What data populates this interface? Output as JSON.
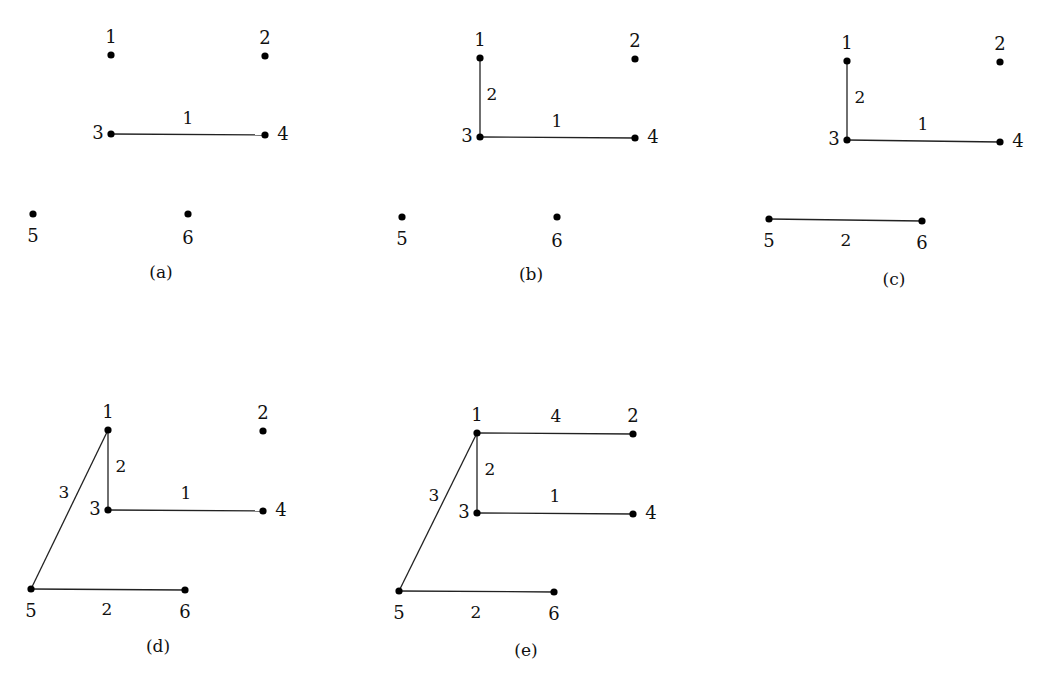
{
  "figure": {
    "vertices": [
      "1",
      "2",
      "3",
      "4",
      "5",
      "6"
    ],
    "panels": [
      {
        "id": "a",
        "caption": "(a)",
        "nodes": [
          {
            "id": "1",
            "x": 111,
            "y": 55,
            "label_dx": 0,
            "label_dy": -12
          },
          {
            "id": "2",
            "x": 265,
            "y": 56,
            "label_dx": 0,
            "label_dy": -12
          },
          {
            "id": "3",
            "x": 111,
            "y": 134,
            "label_dx": -13,
            "label_dy": 5
          },
          {
            "id": "4",
            "x": 265,
            "y": 135,
            "label_dx": 18,
            "label_dy": 5
          },
          {
            "id": "5",
            "x": 33,
            "y": 214,
            "label_dx": 0,
            "label_dy": 28
          },
          {
            "id": "6",
            "x": 188,
            "y": 214,
            "label_dx": 0,
            "label_dy": 30
          }
        ],
        "edges": [
          {
            "from": "3",
            "to": "4",
            "weight": "1",
            "wx": 188,
            "wy": 124
          }
        ],
        "caption_x": 161,
        "caption_y": 278
      },
      {
        "id": "b",
        "caption": "(b)",
        "nodes": [
          {
            "id": "1",
            "x": 480,
            "y": 58,
            "label_dx": 0,
            "label_dy": -12
          },
          {
            "id": "2",
            "x": 635,
            "y": 59,
            "label_dx": 0,
            "label_dy": -12
          },
          {
            "id": "3",
            "x": 480,
            "y": 137,
            "label_dx": -13,
            "label_dy": 5
          },
          {
            "id": "4",
            "x": 635,
            "y": 138,
            "label_dx": 18,
            "label_dy": 5
          },
          {
            "id": "5",
            "x": 402,
            "y": 217,
            "label_dx": 0,
            "label_dy": 28
          },
          {
            "id": "6",
            "x": 557,
            "y": 217,
            "label_dx": 0,
            "label_dy": 30
          }
        ],
        "edges": [
          {
            "from": "3",
            "to": "4",
            "weight": "1",
            "wx": 557,
            "wy": 127
          },
          {
            "from": "1",
            "to": "3",
            "weight": "2",
            "wx": 492,
            "wy": 100
          }
        ],
        "caption_x": 531,
        "caption_y": 280
      },
      {
        "id": "c",
        "caption": "(c)",
        "nodes": [
          {
            "id": "1",
            "x": 847,
            "y": 61,
            "label_dx": 0,
            "label_dy": -12
          },
          {
            "id": "2",
            "x": 1000,
            "y": 62,
            "label_dx": 0,
            "label_dy": -12
          },
          {
            "id": "3",
            "x": 847,
            "y": 140,
            "label_dx": -13,
            "label_dy": 5
          },
          {
            "id": "4",
            "x": 1000,
            "y": 142,
            "label_dx": 18,
            "label_dy": 5
          },
          {
            "id": "5",
            "x": 769,
            "y": 219,
            "label_dx": 0,
            "label_dy": 28
          },
          {
            "id": "6",
            "x": 922,
            "y": 221,
            "label_dx": 0,
            "label_dy": 28
          }
        ],
        "edges": [
          {
            "from": "3",
            "to": "4",
            "weight": "1",
            "wx": 923,
            "wy": 130
          },
          {
            "from": "1",
            "to": "3",
            "weight": "2",
            "wx": 860,
            "wy": 103
          },
          {
            "from": "5",
            "to": "6",
            "weight": "2",
            "wx": 846,
            "wy": 246
          }
        ],
        "caption_x": 894,
        "caption_y": 285
      },
      {
        "id": "d",
        "caption": "(d)",
        "nodes": [
          {
            "id": "1",
            "x": 108,
            "y": 430,
            "label_dx": 0,
            "label_dy": -12
          },
          {
            "id": "2",
            "x": 263,
            "y": 431,
            "label_dx": 0,
            "label_dy": -12
          },
          {
            "id": "3",
            "x": 108,
            "y": 510,
            "label_dx": -13,
            "label_dy": 5
          },
          {
            "id": "4",
            "x": 263,
            "y": 511,
            "label_dx": 18,
            "label_dy": 5
          },
          {
            "id": "5",
            "x": 31,
            "y": 589,
            "label_dx": 0,
            "label_dy": 28
          },
          {
            "id": "6",
            "x": 185,
            "y": 590,
            "label_dx": 0,
            "label_dy": 28
          }
        ],
        "edges": [
          {
            "from": "3",
            "to": "4",
            "weight": "1",
            "wx": 186,
            "wy": 499
          },
          {
            "from": "1",
            "to": "3",
            "weight": "2",
            "wx": 121,
            "wy": 472
          },
          {
            "from": "5",
            "to": "6",
            "weight": "2",
            "wx": 107,
            "wy": 615
          },
          {
            "from": "1",
            "to": "5",
            "weight": "3",
            "wx": 64,
            "wy": 498
          }
        ],
        "caption_x": 158,
        "caption_y": 652
      },
      {
        "id": "e",
        "caption": "(e)",
        "nodes": [
          {
            "id": "1",
            "x": 477,
            "y": 433,
            "label_dx": 0,
            "label_dy": -12
          },
          {
            "id": "2",
            "x": 633,
            "y": 434,
            "label_dx": 0,
            "label_dy": -12
          },
          {
            "id": "3",
            "x": 477,
            "y": 513,
            "label_dx": -13,
            "label_dy": 5
          },
          {
            "id": "4",
            "x": 633,
            "y": 514,
            "label_dx": 18,
            "label_dy": 5
          },
          {
            "id": "5",
            "x": 399,
            "y": 591,
            "label_dx": 0,
            "label_dy": 28
          },
          {
            "id": "6",
            "x": 554,
            "y": 592,
            "label_dx": 0,
            "label_dy": 28
          }
        ],
        "edges": [
          {
            "from": "3",
            "to": "4",
            "weight": "1",
            "wx": 555,
            "wy": 502
          },
          {
            "from": "1",
            "to": "3",
            "weight": "2",
            "wx": 490,
            "wy": 475
          },
          {
            "from": "5",
            "to": "6",
            "weight": "2",
            "wx": 476,
            "wy": 618
          },
          {
            "from": "1",
            "to": "5",
            "weight": "3",
            "wx": 434,
            "wy": 501
          },
          {
            "from": "1",
            "to": "2",
            "weight": "4",
            "wx": 556,
            "wy": 422
          }
        ],
        "caption_x": 526,
        "caption_y": 656
      }
    ]
  }
}
